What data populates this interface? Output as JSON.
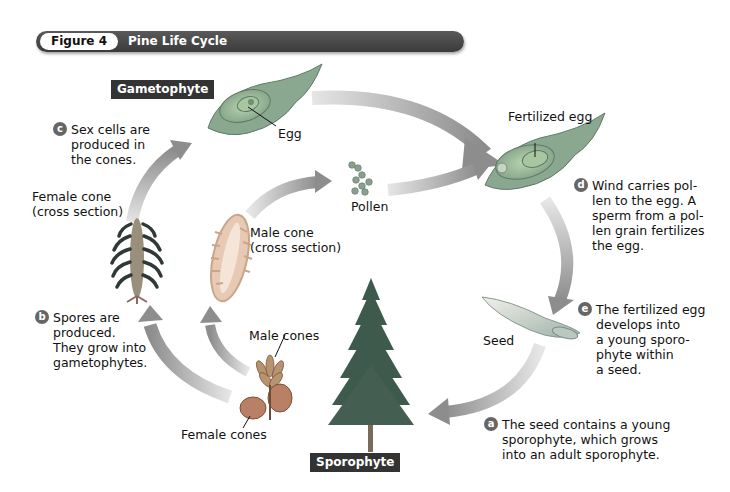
{
  "figure": {
    "number_label": "Figure 4",
    "title": "Pine Life Cycle"
  },
  "stage_labels": {
    "gametophyte": "Gametophyte",
    "sporophyte": "Sporophyte"
  },
  "labels": {
    "egg": "Egg",
    "fertilized_egg": "Fertilized egg",
    "pollen": "Pollen",
    "female_cone_cross_section": "Female cone\n(cross section)",
    "male_cone_cross_section": "Male cone\n(cross section)",
    "male_cones": "Male cones",
    "female_cones": "Female cones",
    "seed": "Seed"
  },
  "steps": [
    {
      "badge": "a",
      "text": "The seed contains a young\nsporophyte, which grows\ninto an adult sporophyte."
    },
    {
      "badge": "b",
      "text": "Spores are\nproduced.\nThey grow into\ngametophytes."
    },
    {
      "badge": "c",
      "text": "Sex cells are\nproduced in\nthe cones."
    },
    {
      "badge": "d",
      "text": "Wind carries pol-\nlen to the egg. A\nsperm from a pol-\nlen grain fertilizes\nthe egg."
    },
    {
      "badge": "e",
      "text": "The fertilized egg\ndevelops into\na young sporo-\nphyte within\na seed."
    }
  ],
  "colors": {
    "title_bar": "#444444",
    "arrow": "#9a9a9a",
    "gametophyte_tissue": "#9ab89a",
    "tree": "#3e5a4c"
  }
}
